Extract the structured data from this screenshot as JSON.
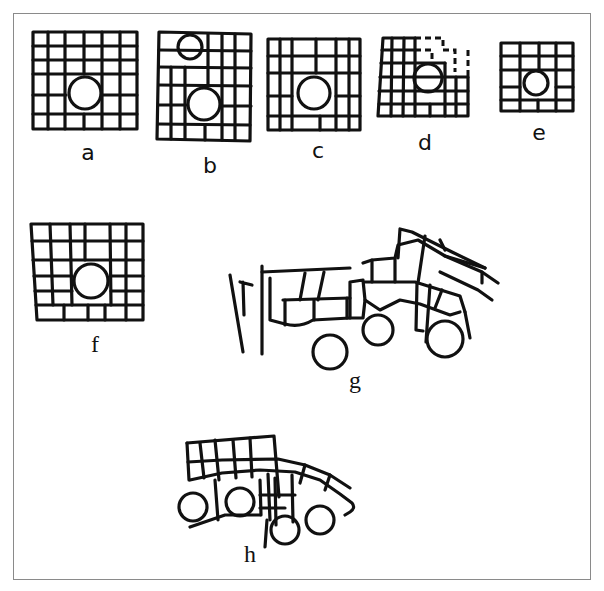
{
  "figure": {
    "panels": [
      {
        "id": "a",
        "label": "a"
      },
      {
        "id": "b",
        "label": "b"
      },
      {
        "id": "c",
        "label": "c"
      },
      {
        "id": "d",
        "label": "d"
      },
      {
        "id": "e",
        "label": "e"
      },
      {
        "id": "f",
        "label": "f"
      },
      {
        "id": "g",
        "label": "g"
      },
      {
        "id": "h",
        "label": "h"
      }
    ],
    "colors": {
      "line": "#111111",
      "background": "#ffffff",
      "frame": "#8a8a8a"
    }
  }
}
